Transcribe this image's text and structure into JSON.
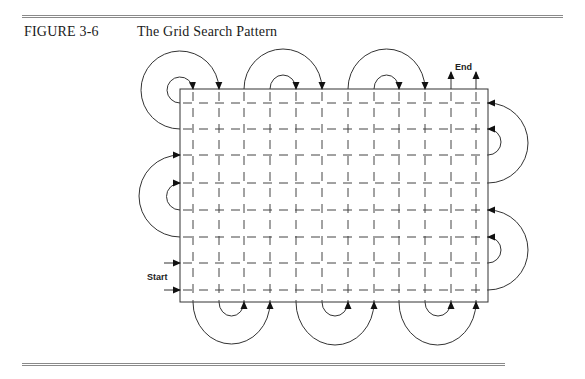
{
  "figure": {
    "number": "FIGURE 3-6",
    "title": "The Grid Search Pattern"
  },
  "diagram": {
    "labels": {
      "start": "Start",
      "end": "End"
    },
    "grid": {
      "columns": 12,
      "rows": 8
    },
    "colors": {
      "line": "#333333",
      "dash": "#444444",
      "rule": "#8a8a8a"
    }
  }
}
